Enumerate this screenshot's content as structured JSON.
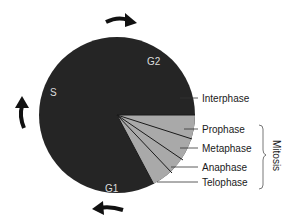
{
  "diagram": {
    "type": "cell-cycle-pie",
    "colors": {
      "interphase": "#252525",
      "mitosis": "#a9a9a9",
      "lines": "#1a1a1a",
      "inner_text": "#dddddd"
    },
    "phase_labels": {
      "s": "S",
      "g2": "G2",
      "g1": "G1"
    },
    "callouts": {
      "interphase": "Interphase",
      "prophase": "Prophase",
      "metaphase": "Metaphase",
      "anaphase": "Anaphase",
      "telophase": "Telophase"
    },
    "group_label": "Mitosis",
    "arrows": [
      "top-clockwise-arrow",
      "left-clockwise-arrow",
      "bottom-clockwise-arrow"
    ]
  }
}
